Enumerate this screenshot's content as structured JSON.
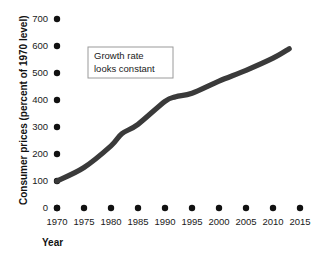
{
  "chart_data": {
    "type": "line",
    "title": "",
    "xlabel": "Year",
    "ylabel": "Consumer prices (percent of 1970 level)",
    "x": [
      1970,
      1975,
      1980,
      1982,
      1985,
      1990,
      1992,
      1995,
      2000,
      2005,
      2010,
      2013
    ],
    "values": [
      100,
      150,
      230,
      275,
      310,
      395,
      412,
      425,
      470,
      510,
      555,
      590
    ],
    "series": [
      {
        "name": "Consumer prices",
        "values": [
          100,
          150,
          230,
          275,
          310,
          395,
          412,
          425,
          470,
          510,
          555,
          590
        ]
      }
    ],
    "xlim": [
      1970,
      2015
    ],
    "ylim": [
      0,
      700
    ],
    "x_ticks": [
      1970,
      1975,
      1980,
      1985,
      1990,
      1995,
      2000,
      2005,
      2010,
      2015
    ],
    "y_ticks": [
      0,
      100,
      200,
      300,
      400,
      500,
      600,
      700
    ],
    "grid": false,
    "legend": "none",
    "line_color": "#3a3a3a",
    "marker_color": "#111111",
    "annotations": [
      {
        "name": "growth-rate-note",
        "line1": "Growth rate",
        "line2": "looks constant"
      }
    ]
  },
  "axes": {
    "y_tick_labels": [
      "0",
      "100",
      "200",
      "300",
      "400",
      "500",
      "600",
      "700"
    ],
    "x_tick_labels": [
      "1970",
      "1975",
      "1980",
      "1985",
      "1990",
      "1995",
      "2000",
      "2005",
      "2010",
      "2015"
    ],
    "y_title": "Consumer prices (percent of 1970 level)",
    "x_title": "Year"
  },
  "annotation": {
    "line1": "Growth rate",
    "line2": "looks constant"
  }
}
